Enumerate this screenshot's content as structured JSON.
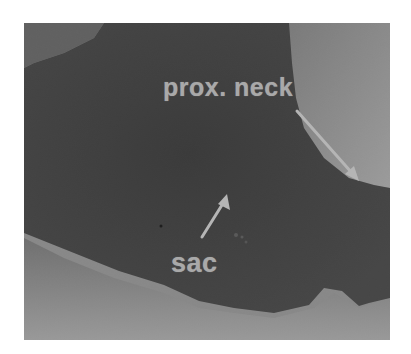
{
  "figure": {
    "colors": {
      "background": "#ffffff",
      "dark_lumen": "#333333",
      "tissue_light": "#9a9a9a",
      "tissue_mid": "#6a6a6a",
      "label_color": "#a9a9a9",
      "arrow_color": "#b5b5b5"
    }
  },
  "annotations": {
    "prox_neck": {
      "label": "prox. neck",
      "arrow_icon": "arrow-down-right"
    },
    "sac": {
      "label": "sac",
      "arrow_icon": "arrow-up-right"
    }
  }
}
